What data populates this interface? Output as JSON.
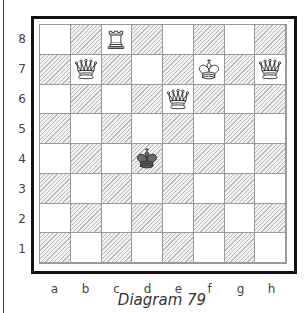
{
  "caption": "Diagram 79",
  "files": [
    "a",
    "b",
    "c",
    "d",
    "e",
    "f",
    "g",
    "h"
  ],
  "ranks": [
    "8",
    "7",
    "6",
    "5",
    "4",
    "3",
    "2",
    "1"
  ],
  "colors": {
    "light_square": "#ffffff",
    "dark_square_hatch": "#b8b8b8",
    "grid_line": "#9a9a9a",
    "frame": "#111111",
    "black_piece": "#6a6a6a"
  },
  "pieces": [
    {
      "square": "c8",
      "type": "rook",
      "color": "white"
    },
    {
      "square": "b7",
      "type": "queen",
      "color": "white"
    },
    {
      "square": "f7",
      "type": "king",
      "color": "white"
    },
    {
      "square": "h7",
      "type": "queen",
      "color": "white"
    },
    {
      "square": "e6",
      "type": "queen",
      "color": "white"
    },
    {
      "square": "d4",
      "type": "king",
      "color": "black"
    }
  ]
}
